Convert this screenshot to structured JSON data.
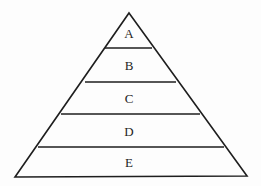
{
  "figure": {
    "type": "pyramid-diagram",
    "shape_name": "triangle",
    "tier_count": 5,
    "background_color": "#fdfdfd",
    "stroke_color": "#1e1e1e",
    "text_color": "#242424",
    "stroke_width": 1.6
  },
  "geometry": {
    "apex": {
      "x": 129,
      "y": 13
    },
    "base_left": {
      "x": 15,
      "y": 177
    },
    "base_right": {
      "x": 247,
      "y": 176
    },
    "dividers": [
      {
        "y": 48,
        "x1": 105,
        "x2": 152
      },
      {
        "y": 82,
        "x1": 85,
        "x2": 176
      },
      {
        "y": 114,
        "x1": 61,
        "x2": 200
      },
      {
        "y": 147,
        "x1": 38,
        "x2": 224
      }
    ]
  },
  "chart_data": {
    "type": "pyramid",
    "title": "",
    "xlabel": "",
    "ylabel": "",
    "categories": [
      "A",
      "B",
      "C",
      "D",
      "E"
    ],
    "values": [
      1,
      2,
      3,
      4,
      5
    ],
    "legend": [],
    "grid": false
  },
  "tiers": [
    {
      "label": "A",
      "center_x": 129,
      "center_y": 33,
      "level": 1
    },
    {
      "label": "B",
      "center_x": 129,
      "center_y": 65,
      "level": 2
    },
    {
      "label": "C",
      "center_x": 129,
      "center_y": 98,
      "level": 3
    },
    {
      "label": "D",
      "center_x": 129,
      "center_y": 131,
      "level": 4
    },
    {
      "label": "E",
      "center_x": 129,
      "center_y": 162,
      "level": 5
    }
  ]
}
